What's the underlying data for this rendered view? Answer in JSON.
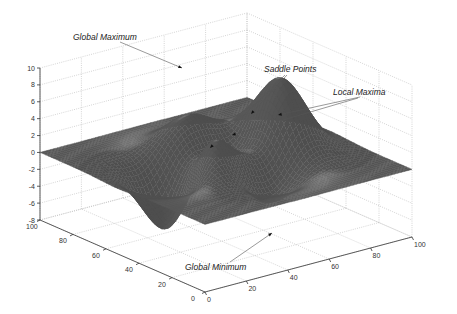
{
  "chart_data": {
    "type": "surface",
    "title": "",
    "function": "peaks",
    "xlabel": "",
    "ylabel": "",
    "zlabel": "",
    "xlim": [
      0,
      100
    ],
    "ylim": [
      0,
      100
    ],
    "zlim": [
      -8,
      10
    ],
    "x_ticks": [
      "0",
      "20",
      "40",
      "60",
      "80",
      "100"
    ],
    "y_ticks": [
      "100",
      "80",
      "60",
      "40",
      "20",
      "0"
    ],
    "z_ticks": [
      "10",
      "8",
      "6",
      "4",
      "2",
      "0",
      "-2",
      "-4",
      "-6",
      "-8"
    ],
    "grid": true,
    "colormap": "gray",
    "annotations": [
      {
        "text": "Global Maximum",
        "approx_z": 8.1
      },
      {
        "text": "Saddle Points",
        "approx_count": 2
      },
      {
        "text": "Local Maxima",
        "approx_count": 2
      },
      {
        "text": "Global Minimum",
        "approx_z": -6.5
      }
    ]
  },
  "labels": {
    "global_max": "Global Maximum",
    "saddle": "Saddle Points",
    "local_max": "Local Maxima",
    "global_min": "Global Minimum"
  },
  "colors": {
    "surface_base": "#5e5e5e",
    "surface_highlight": "#d8d8d8",
    "grid": "#b8b8b8",
    "axis": "#333333"
  }
}
